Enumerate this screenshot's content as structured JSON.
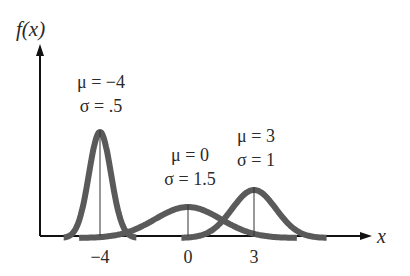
{
  "chart_data": {
    "type": "line",
    "title": "",
    "ylabel": "f(x)",
    "xlabel": "x",
    "xticks": [
      "−4",
      "0",
      "3"
    ],
    "series": [
      {
        "name": "mu=-4, sigma=.5",
        "mu": -4,
        "sigma": 0.5,
        "label_mu": "μ = −4",
        "label_sigma": "σ = .5"
      },
      {
        "name": "mu=0, sigma=1.5",
        "mu": 0,
        "sigma": 1.5,
        "label_mu": "μ = 0",
        "label_sigma": "σ = 1.5"
      },
      {
        "name": "mu=3, sigma=1",
        "mu": 3,
        "sigma": 1,
        "label_mu": "μ = 3",
        "label_sigma": "σ = 1"
      }
    ],
    "curve_color": "#5a5a5a",
    "axis_color": "#111111"
  },
  "labels": {
    "ylabel": "f(x)",
    "xlabel": "x",
    "tick_m4": "−4",
    "tick_0": "0",
    "tick_3": "3",
    "c1_mu": "μ = −4",
    "c1_sigma": "σ = .5",
    "c2_mu": "μ = 0",
    "c2_sigma": "σ = 1.5",
    "c3_mu": "μ = 3",
    "c3_sigma": "σ = 1"
  }
}
